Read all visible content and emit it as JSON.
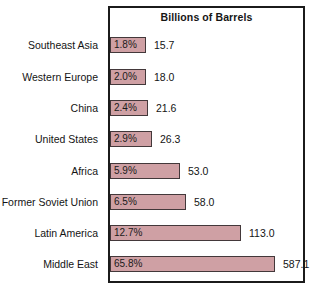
{
  "chart_data": {
    "type": "bar",
    "orientation": "horizontal",
    "title": "Billions of Barrels",
    "xlabel": "",
    "ylabel": "",
    "grid": false,
    "legend": "none",
    "categories": [
      "Southeast Asia",
      "Western Europe",
      "China",
      "United States",
      "Africa",
      "Former Soviet Union",
      "Latin America",
      "Middle East"
    ],
    "values": [
      15.7,
      18.0,
      21.6,
      26.3,
      53.0,
      58.0,
      113.0,
      587.1
    ],
    "percent_labels": [
      "1.8%",
      "2.0%",
      "2.4%",
      "2.9%",
      "5.9%",
      "6.5%",
      "12.7%",
      "65.8%"
    ],
    "value_labels": [
      "15.7",
      "18.0",
      "21.6",
      "26.3",
      "53.0",
      "58.0",
      "113.0",
      "587.1"
    ],
    "percents": [
      1.8,
      2.0,
      2.4,
      2.9,
      5.9,
      6.5,
      12.7,
      65.8
    ],
    "bar_color": "#cfa0a4",
    "bar_border_color": "#43383a",
    "frame_color": "#1b1b1b",
    "rows": [
      {
        "category": "Southeast Asia",
        "percent_label": "1.8%",
        "value_label": "15.7",
        "value": 15.7,
        "percent": 1.8,
        "bar_px": 36,
        "top": 37
      },
      {
        "category": "Western Europe",
        "percent_label": "2.0%",
        "value_label": "18.0",
        "value": 18.0,
        "percent": 2.0,
        "bar_px": 36,
        "top": 69
      },
      {
        "category": "China",
        "percent_label": "2.4%",
        "value_label": "21.6",
        "value": 21.6,
        "percent": 2.4,
        "bar_px": 38,
        "top": 100
      },
      {
        "category": "United States",
        "percent_label": "2.9%",
        "value_label": "26.3",
        "value": 26.3,
        "percent": 2.9,
        "bar_px": 42,
        "top": 131
      },
      {
        "category": "Africa",
        "percent_label": "5.9%",
        "value_label": "53.0",
        "value": 53.0,
        "percent": 5.9,
        "bar_px": 70,
        "top": 163
      },
      {
        "category": "Former Soviet Union",
        "percent_label": "6.5%",
        "value_label": "58.0",
        "value": 58.0,
        "percent": 6.5,
        "bar_px": 76,
        "top": 194
      },
      {
        "category": "Latin America",
        "percent_label": "12.7%",
        "value_label": "113.0",
        "value": 113.0,
        "percent": 12.7,
        "bar_px": 131,
        "top": 225
      },
      {
        "category": "Middle East",
        "percent_label": "65.8%",
        "value_label": "587.1",
        "value": 587.1,
        "percent": 65.8,
        "bar_px": 165,
        "top": 256
      }
    ]
  }
}
